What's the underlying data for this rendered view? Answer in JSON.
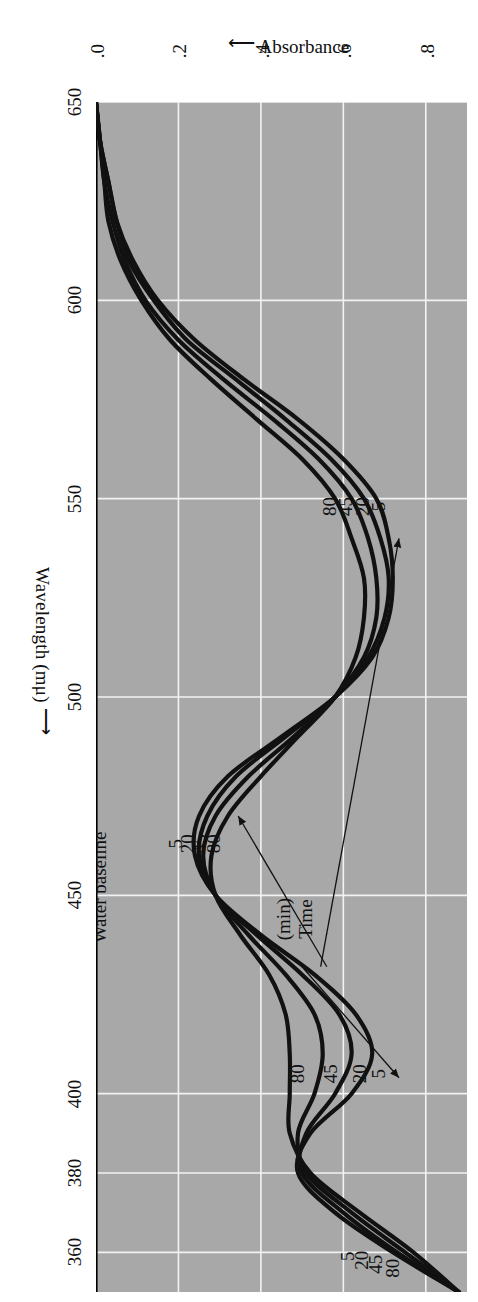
{
  "figure": {
    "background_color": "#ffffff",
    "panel_color": "#a8a8a8",
    "grid_color": "#f2f2f2",
    "curve_color": "#111111"
  },
  "axes": {
    "x_title": "Wavelength (mμ)",
    "x_arrow": "⟶",
    "y_title": "Absorbance",
    "y_arrow": "⟵",
    "x_ticks": [
      "360",
      "380",
      "400",
      "450",
      "500",
      "550",
      "600",
      "650"
    ],
    "y_ticks": [
      ".8",
      ".6",
      ".4",
      ".2",
      ".0"
    ]
  },
  "annotations": {
    "baseline_label": "Water baseline",
    "legend_title_line1": "Time",
    "legend_title_line2": "(min)",
    "series_labels": [
      "5",
      "20",
      "45",
      "80"
    ]
  },
  "chart_data": {
    "type": "line",
    "title": "",
    "xlabel": "Wavelength (mμ)",
    "ylabel": "Absorbance",
    "xlim": [
      350,
      650
    ],
    "ylim": [
      0.0,
      0.9
    ],
    "x_tick_values": [
      360,
      380,
      400,
      450,
      500,
      550,
      600,
      650
    ],
    "y_tick_values": [
      0.8,
      0.6,
      0.4,
      0.2,
      0.0
    ],
    "x_axis_direction": "decreasing-left-to-right-reversed",
    "grid": true,
    "legend": "inline curve labels",
    "legend_title": "Time (min)",
    "baseline": {
      "label": "Water baseline",
      "value": 0.0
    },
    "series": [
      {
        "name": "5",
        "unit": "min",
        "x": [
          350,
          360,
          370,
          380,
          390,
          400,
          410,
          420,
          430,
          440,
          450,
          460,
          470,
          480,
          490,
          500,
          510,
          520,
          530,
          540,
          550,
          560,
          570,
          580,
          590,
          600,
          610,
          620,
          630,
          640,
          650
        ],
        "y": [
          0.88,
          0.72,
          0.58,
          0.49,
          0.52,
          0.62,
          0.67,
          0.63,
          0.53,
          0.4,
          0.29,
          0.24,
          0.25,
          0.32,
          0.45,
          0.58,
          0.67,
          0.71,
          0.72,
          0.71,
          0.68,
          0.6,
          0.49,
          0.36,
          0.24,
          0.15,
          0.09,
          0.05,
          0.03,
          0.01,
          0.0
        ]
      },
      {
        "name": "20",
        "unit": "min",
        "x": [
          350,
          360,
          370,
          380,
          390,
          400,
          410,
          420,
          430,
          440,
          450,
          460,
          470,
          480,
          490,
          500,
          510,
          520,
          530,
          540,
          550,
          560,
          570,
          580,
          590,
          600,
          610,
          620,
          630,
          640,
          650
        ],
        "y": [
          0.88,
          0.73,
          0.6,
          0.5,
          0.51,
          0.58,
          0.62,
          0.59,
          0.5,
          0.39,
          0.29,
          0.25,
          0.27,
          0.34,
          0.46,
          0.58,
          0.66,
          0.7,
          0.71,
          0.69,
          0.65,
          0.57,
          0.46,
          0.34,
          0.22,
          0.14,
          0.08,
          0.05,
          0.03,
          0.01,
          0.0
        ]
      },
      {
        "name": "45",
        "unit": "min",
        "x": [
          350,
          360,
          370,
          380,
          390,
          400,
          410,
          420,
          430,
          440,
          450,
          460,
          470,
          480,
          490,
          500,
          510,
          520,
          530,
          540,
          550,
          560,
          570,
          580,
          590,
          600,
          610,
          620,
          630,
          640,
          650
        ],
        "y": [
          0.88,
          0.75,
          0.62,
          0.51,
          0.49,
          0.53,
          0.55,
          0.53,
          0.46,
          0.37,
          0.29,
          0.26,
          0.29,
          0.37,
          0.48,
          0.58,
          0.65,
          0.68,
          0.68,
          0.66,
          0.62,
          0.54,
          0.43,
          0.31,
          0.2,
          0.12,
          0.07,
          0.04,
          0.02,
          0.01,
          0.0
        ]
      },
      {
        "name": "80",
        "unit": "min",
        "x": [
          350,
          360,
          370,
          380,
          390,
          400,
          410,
          420,
          430,
          440,
          450,
          460,
          470,
          480,
          490,
          500,
          510,
          520,
          530,
          540,
          550,
          560,
          570,
          580,
          590,
          600,
          610,
          620,
          630,
          640,
          650
        ],
        "y": [
          0.88,
          0.77,
          0.64,
          0.52,
          0.47,
          0.47,
          0.47,
          0.46,
          0.42,
          0.35,
          0.29,
          0.28,
          0.32,
          0.4,
          0.49,
          0.58,
          0.63,
          0.65,
          0.65,
          0.62,
          0.58,
          0.5,
          0.39,
          0.28,
          0.18,
          0.11,
          0.06,
          0.03,
          0.02,
          0.01,
          0.0
        ]
      }
    ]
  }
}
